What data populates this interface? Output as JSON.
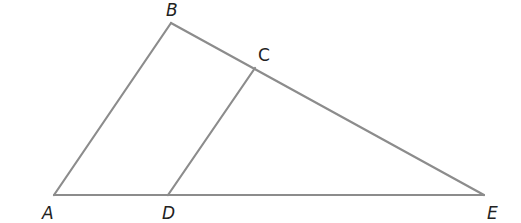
{
  "diagram": {
    "type": "geometry",
    "stroke_color": "#8c8c8c",
    "label_color": "#222222",
    "points": {
      "A": {
        "label": "A",
        "x": 54,
        "y": 195,
        "label_x": 42,
        "label_y": 219
      },
      "B": {
        "label": "B",
        "x": 171,
        "y": 23,
        "label_x": 166,
        "label_y": 16
      },
      "C": {
        "label": "C",
        "x": 255,
        "y": 68,
        "label_x": 258,
        "label_y": 61
      },
      "D": {
        "label": "D",
        "x": 168,
        "y": 195,
        "label_x": 162,
        "label_y": 219
      },
      "E": {
        "label": "E",
        "x": 484,
        "y": 195,
        "label_x": 487,
        "label_y": 219
      }
    },
    "segments": [
      {
        "name": "AB",
        "from": "A",
        "to": "B"
      },
      {
        "name": "BE",
        "from": "B",
        "to": "E"
      },
      {
        "name": "AE",
        "from": "A",
        "to": "E"
      },
      {
        "name": "CD",
        "from": "C",
        "to": "D"
      }
    ]
  }
}
